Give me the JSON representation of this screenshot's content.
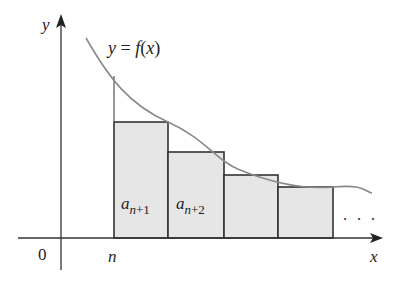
{
  "figure": {
    "type": "integral test diagram (right-endpoint rectangles under decreasing curve)",
    "curve_label": "y = f(x)",
    "axes": {
      "x_label": "x",
      "y_label": "y",
      "origin_label": "0",
      "tick_label": "n"
    },
    "rectangles": [
      {
        "label_main": "a",
        "label_sub": "n+1"
      },
      {
        "label_main": "a",
        "label_sub": "n+2"
      },
      {
        "label_main": "",
        "label_sub": ""
      },
      {
        "label_main": "",
        "label_sub": ""
      }
    ],
    "ellipsis": ". . .",
    "colors": {
      "rect_fill": "#e6e6e6",
      "rect_stroke": "#333333",
      "curve": "#888888",
      "axis": "#333333"
    }
  },
  "labels": {
    "y_eq": "y = ",
    "f": "f",
    "x_paren": "(x)",
    "a1": "a",
    "a1_sub": "n+1",
    "a2": "a",
    "a2_sub": "n+2",
    "y": "y",
    "x": "x",
    "zero": "0",
    "n": "n",
    "dots": ". . ."
  }
}
